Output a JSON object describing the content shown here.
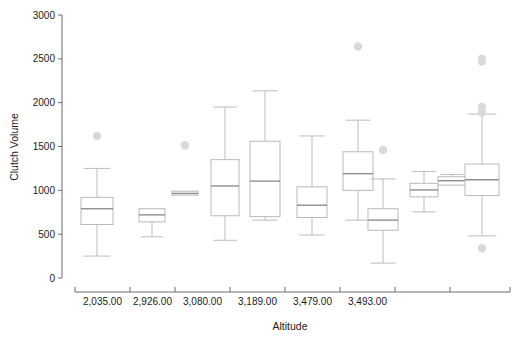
{
  "chart_data": {
    "type": "box",
    "title": "",
    "xlabel": "Altitude",
    "ylabel": "Clutch Volume",
    "ylim": [
      0,
      3000
    ],
    "yticks": [
      0,
      500,
      1000,
      1500,
      2000,
      2500,
      3000
    ],
    "ytick_labels": [
      "0",
      "500",
      "1000",
      "1500",
      "2000",
      "2500",
      "3000"
    ],
    "grid": false,
    "legend": null,
    "categories": [
      "2,035.00",
      "2,926.00",
      "3,080.00",
      "3,189.00",
      "3,479.00",
      "3,493.00"
    ],
    "group_membership": [
      1,
      1,
      2,
      2,
      2,
      2,
      3,
      3,
      4,
      5,
      6
    ],
    "boxes": [
      {
        "name": "box-1",
        "category": "2,035.00",
        "whisker_low": 250,
        "q1": 610,
        "median": 790,
        "q3": 920,
        "whisker_high": 1250,
        "outliers": [
          1620
        ]
      },
      {
        "name": "box-2",
        "category": "2,035.00",
        "whisker_low": 470,
        "q1": 640,
        "median": 720,
        "q3": 790,
        "whisker_high": 790,
        "outliers": []
      },
      {
        "name": "box-3",
        "category": "2,926.00",
        "whisker_low": 945,
        "q1": 945,
        "median": 965,
        "q3": 990,
        "whisker_high": 990,
        "outliers": [
          1515
        ]
      },
      {
        "name": "box-4",
        "category": "2,926.00",
        "whisker_low": 430,
        "q1": 710,
        "median": 1050,
        "q3": 1350,
        "whisker_high": 1950,
        "outliers": []
      },
      {
        "name": "box-5",
        "category": "3,080.00",
        "whisker_low": 660,
        "q1": 700,
        "median": 1105,
        "q3": 1560,
        "whisker_high": 2135,
        "outliers": []
      },
      {
        "name": "box-6",
        "category": "3,080.00",
        "whisker_low": 490,
        "q1": 690,
        "median": 830,
        "q3": 1040,
        "whisker_high": 1620,
        "outliers": []
      },
      {
        "name": "box-7",
        "category": "3,189.00",
        "whisker_low": 660,
        "q1": 1000,
        "median": 1190,
        "q3": 1440,
        "whisker_high": 1800,
        "outliers": [
          2640
        ]
      },
      {
        "name": "box-8",
        "category": "3,189.00",
        "whisker_low": 170,
        "q1": 545,
        "median": 660,
        "q3": 790,
        "whisker_high": 1130,
        "outliers": [
          1460
        ]
      },
      {
        "name": "box-9",
        "category": "3,479.00",
        "whisker_low": 755,
        "q1": 925,
        "median": 1005,
        "q3": 1080,
        "whisker_high": 1215,
        "outliers": []
      },
      {
        "name": "box-10",
        "category": "3,479.00",
        "whisker_low": 1060,
        "q1": 1060,
        "median": 1110,
        "q3": 1155,
        "whisker_high": 1180,
        "outliers": []
      },
      {
        "name": "box-11",
        "category": "3,493.00",
        "whisker_low": 480,
        "q1": 940,
        "median": 1120,
        "q3": 1300,
        "whisker_high": 1870,
        "outliers": [
          2500,
          2470,
          1950,
          1890,
          340
        ]
      }
    ],
    "box_x_centers": [
      97,
      152,
      185,
      225,
      265,
      312,
      358,
      383,
      424,
      452,
      482
    ],
    "box_widths": [
      32,
      26,
      26,
      28,
      30,
      30,
      30,
      30,
      28,
      28,
      34
    ],
    "category_tick_x": [
      75,
      130,
      175,
      230,
      285,
      340,
      395,
      450,
      510
    ],
    "colors": {
      "axis": "#6b6b6b",
      "box_stroke": "#b9b9b9",
      "median": "#8f8f8f",
      "whisker": "#bdbdbd",
      "outlier": "#d9d9dd",
      "background": "#ffffff"
    }
  }
}
